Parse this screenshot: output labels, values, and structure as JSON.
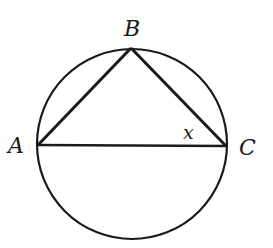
{
  "diagram": {
    "type": "inscribed-triangle",
    "colors": {
      "stroke": "#1a1a1a",
      "background": "#ffffff"
    },
    "circle": {
      "cx": 132,
      "cy": 144,
      "r": 95
    },
    "points": {
      "A": {
        "label": "A",
        "x": 38,
        "y": 145
      },
      "B": {
        "label": "B",
        "x": 131,
        "y": 48
      },
      "C": {
        "label": "C",
        "x": 226,
        "y": 146
      }
    },
    "segments": [
      {
        "from": "A",
        "to": "B"
      },
      {
        "from": "B",
        "to": "C"
      },
      {
        "from": "A",
        "to": "C"
      }
    ],
    "angle_label": {
      "text": "x",
      "vertex": "C"
    }
  }
}
